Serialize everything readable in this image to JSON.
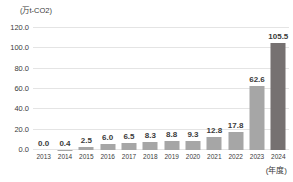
{
  "chart_data": {
    "type": "bar",
    "title": "",
    "subtitle": "",
    "xlabel": "(年度)",
    "ylabel": "(万t-CO2)",
    "categories": [
      "2013",
      "2014",
      "2015",
      "2016",
      "2017",
      "2018",
      "2019",
      "2020",
      "2021",
      "2022",
      "2023",
      "2024"
    ],
    "values": [
      0.0,
      0.4,
      2.5,
      6.0,
      6.5,
      8.3,
      8.8,
      9.3,
      12.8,
      17.8,
      62.6,
      105.5
    ],
    "value_labels": [
      "0.0",
      "0.4",
      "2.5",
      "6.0",
      "6.5",
      "8.3",
      "8.8",
      "9.3",
      "12.8",
      "17.8",
      "62.6",
      "105.5"
    ],
    "ylim": [
      0,
      120
    ],
    "ytick_values": [
      0,
      20,
      40,
      60,
      80,
      100,
      120
    ],
    "ytick_labels": [
      "0.0",
      "20.0",
      "40.0",
      "60.0",
      "80.0",
      "100.0",
      "120.0"
    ],
    "grid": true,
    "legend": false,
    "legend_position": "none",
    "series": [
      {
        "name": "",
        "values": [
          0.0,
          0.4,
          2.5,
          6.0,
          6.5,
          8.3,
          8.8,
          9.3,
          12.8,
          17.8,
          62.6,
          105.5
        ]
      }
    ],
    "highlight_index": 11,
    "colors": {
      "bar": "#a6a6a6",
      "bar_highlight": "#767171",
      "gridline": "#e4e4e4",
      "text": "#3b3b3b",
      "background": "#ffffff"
    }
  }
}
